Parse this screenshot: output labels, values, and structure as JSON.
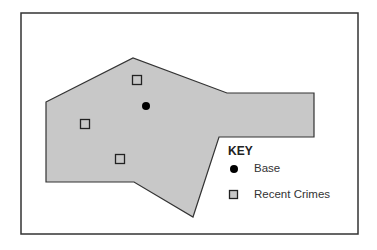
{
  "map": {
    "frame": {
      "x": 21,
      "y": 13,
      "width": 337,
      "height": 221
    },
    "region": {
      "fill": "#c8c8c8",
      "stroke": "#333333",
      "points": [
        [
          46,
          102
        ],
        [
          133,
          58
        ],
        [
          227,
          93
        ],
        [
          314,
          93
        ],
        [
          314,
          137
        ],
        [
          219,
          137
        ],
        [
          193,
          217
        ],
        [
          134,
          182
        ],
        [
          46,
          182
        ]
      ]
    },
    "base": {
      "x": 146,
      "y": 106,
      "r": 4,
      "color": "#000000"
    },
    "recent_crimes": [
      {
        "x": 137,
        "y": 80
      },
      {
        "x": 85,
        "y": 124
      },
      {
        "x": 120,
        "y": 159
      }
    ]
  },
  "legend": {
    "title": "KEY",
    "items": [
      {
        "icon": "filled-circle-icon",
        "label": "Base"
      },
      {
        "icon": "square-outline-icon",
        "label": "Recent Crimes"
      }
    ]
  }
}
